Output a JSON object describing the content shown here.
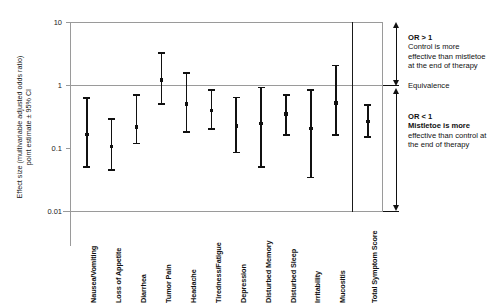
{
  "chart_data": {
    "type": "scatter",
    "title": "",
    "subtitle": "",
    "ylabel": "Effect size (multivariable adjusted odds ratio)\npoint estimate ± 95% CI",
    "xlabel": "",
    "yscale": "log",
    "ylim": [
      0.01,
      10
    ],
    "yticks": [
      "10",
      "1",
      "0.1",
      "0.01"
    ],
    "ytick_values": [
      10,
      1,
      0.1,
      0.01
    ],
    "grid": false,
    "reference_line": 1,
    "legend": "none",
    "categories": [
      "Nausea/Vomiting",
      "Loss of Appetite",
      "Diarrhea",
      "Tumor Pain",
      "Headache",
      "Tiredness/Fatigue",
      "Depression",
      "Disturbed Memory",
      "Disturbed Sleep",
      "Irritability",
      "Mucositis",
      "Total Symptom Score"
    ],
    "series": [
      {
        "name": "Adjusted odds ratio (point estimate with 95% CI)",
        "points": [
          {
            "category": "Nausea/Vomiting",
            "estimate": 0.165,
            "ci_low": 0.048,
            "ci_high": 0.64
          },
          {
            "category": "Loss of Appetite",
            "estimate": 0.105,
            "ci_low": 0.043,
            "ci_high": 0.3
          },
          {
            "category": "Diarrhea",
            "estimate": 0.215,
            "ci_low": 0.115,
            "ci_high": 0.72
          },
          {
            "category": "Tumor Pain",
            "estimate": 1.2,
            "ci_low": 0.49,
            "ci_high": 3.3
          },
          {
            "category": "Headache",
            "estimate": 0.5,
            "ci_low": 0.175,
            "ci_high": 1.58
          },
          {
            "category": "Tiredness/Fatigue",
            "estimate": 0.39,
            "ci_low": 0.195,
            "ci_high": 0.86
          },
          {
            "category": "Depression",
            "estimate": 0.225,
            "ci_low": 0.082,
            "ci_high": 0.65
          },
          {
            "category": "Disturbed Memory",
            "estimate": 0.245,
            "ci_low": 0.049,
            "ci_high": 0.94
          },
          {
            "category": "Disturbed Sleep",
            "estimate": 0.345,
            "ci_low": 0.155,
            "ci_high": 0.72
          },
          {
            "category": "Irritability",
            "estimate": 0.205,
            "ci_low": 0.033,
            "ci_high": 0.86
          },
          {
            "category": "Mucositis",
            "estimate": 0.52,
            "ci_low": 0.155,
            "ci_high": 2.1
          },
          {
            "category": "Total Symptom Score",
            "estimate": 0.265,
            "ci_low": 0.145,
            "ci_high": 0.5
          }
        ]
      }
    ],
    "annotations": [
      {
        "id": "above-one",
        "heading": "OR > 1",
        "body": "Control is more effective than mistletoe at the end of therapy"
      },
      {
        "id": "equivalence",
        "heading": "Equivalence",
        "body": ""
      },
      {
        "id": "below-one",
        "heading": "OR < 1",
        "body": "Mistletoe is more effective than control at the end of therapy"
      }
    ]
  }
}
